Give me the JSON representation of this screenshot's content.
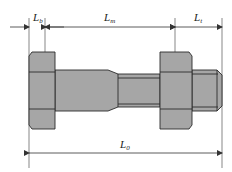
{
  "diagram": {
    "colors": {
      "fill": "#a6a6a6",
      "stroke": "#2a2a2a",
      "dim_line": "#333333",
      "background": "#ffffff"
    },
    "labels": {
      "lb": {
        "main": "L",
        "sub": "b"
      },
      "lm": {
        "main": "L",
        "sub": "m"
      },
      "lt": {
        "main": "L",
        "sub": "t"
      },
      "l0": {
        "main": "L",
        "sub": "0"
      }
    }
  }
}
